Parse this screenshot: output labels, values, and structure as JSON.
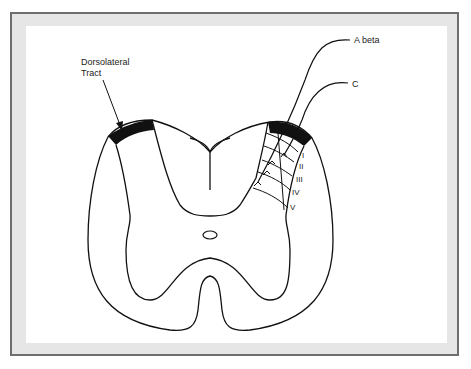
{
  "figure": {
    "type": "spinal-cord-cross-section",
    "labels": {
      "dorsolateral_tract_line1": "Dorsolateral",
      "dorsolateral_tract_line2": "Tract",
      "a_beta": "A beta",
      "c_fiber": "C"
    },
    "laminae": [
      "I",
      "II",
      "III",
      "IV",
      "V"
    ],
    "colors": {
      "frame_border": "#6e6e6e",
      "frame_band": "#e6e6e6",
      "background": "#ffffff",
      "ink": "#111111"
    }
  }
}
